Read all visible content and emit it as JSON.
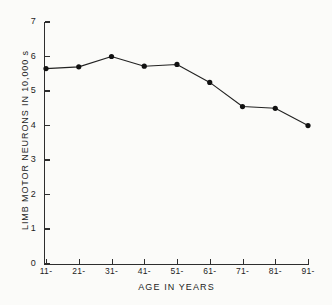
{
  "chart_data": {
    "type": "line",
    "title": "",
    "xlabel": "AGE IN YEARS",
    "ylabel": "LIMB MOTOR NEURONS IN 10,000 s",
    "categories": [
      "11-",
      "21-",
      "31-",
      "41-",
      "51-",
      "61-",
      "71-",
      "81-",
      "91-"
    ],
    "values": [
      5.65,
      5.7,
      6.0,
      5.72,
      5.77,
      5.25,
      4.55,
      4.5,
      4.0
    ],
    "series": [
      {
        "name": "Limb motor neurons",
        "values": [
          5.65,
          5.7,
          6.0,
          5.72,
          5.77,
          5.25,
          4.55,
          4.5,
          4.0
        ]
      }
    ],
    "ylim": [
      0,
      7
    ],
    "yticks": [
      0,
      1,
      2,
      3,
      4,
      5,
      6,
      7
    ],
    "ytick_labels": [
      "0",
      "1",
      "2",
      "3",
      "4",
      "5",
      "6",
      "7"
    ],
    "grid": false,
    "legend": false,
    "marker": "filled-circle",
    "line_color": "#222222",
    "marker_color": "#111111",
    "background_color": "#fbfbf9"
  },
  "axes": {
    "y_title": "LIMB MOTOR NEURONS IN 10,000 s",
    "x_title": "AGE IN YEARS"
  }
}
